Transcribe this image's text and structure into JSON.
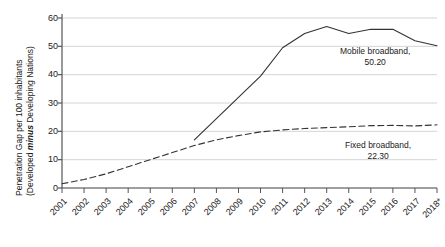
{
  "chart_data": {
    "type": "line",
    "title": "",
    "subtitle": "",
    "xlabel": "",
    "ylabel": "Penetration Gap per 100 inhabitants (Developed minus Developing Nations)",
    "ylabel_line1": "Penetration Gap per 100 inhabitants",
    "ylabel_line2_pre": "(Developed ",
    "ylabel_line2_em": "minus",
    "ylabel_line2_post": " Developing Nations)",
    "x": [
      "2001",
      "2002",
      "2003",
      "2004",
      "2005",
      "2006",
      "2007",
      "2008",
      "2009",
      "2010",
      "2011",
      "2012",
      "2013",
      "2014",
      "2015",
      "2016",
      "2017",
      "2018*"
    ],
    "xlim": [
      2001,
      2018
    ],
    "ylim": [
      0,
      60
    ],
    "yticks": [
      0,
      10,
      20,
      30,
      40,
      50,
      60
    ],
    "grid": true,
    "grid_axis": "y",
    "legend": "annotations",
    "series": [
      {
        "name": "Mobile broadband",
        "style": "solid",
        "color": "#333333",
        "end_label": "Mobile broadband,",
        "end_value_label": "50.20",
        "x": [
          "2007",
          "2008",
          "2009",
          "2010",
          "2011",
          "2012",
          "2013",
          "2014",
          "2015",
          "2016",
          "2017",
          "2018*"
        ],
        "values": [
          17.0,
          24.5,
          32.0,
          39.5,
          49.5,
          54.5,
          57.0,
          54.5,
          56.0,
          56.0,
          52.0,
          50.2
        ]
      },
      {
        "name": "Fixed broadband",
        "style": "dashed",
        "color": "#333333",
        "end_label": "Fixed broadband,",
        "end_value_label": "22.30",
        "x": [
          "2001",
          "2002",
          "2003",
          "2004",
          "2005",
          "2006",
          "2007",
          "2008",
          "2009",
          "2010",
          "2011",
          "2012",
          "2013",
          "2014",
          "2015",
          "2016",
          "2017",
          "2018*"
        ],
        "values": [
          1.5,
          3.0,
          5.0,
          7.5,
          10.0,
          12.5,
          15.0,
          17.0,
          18.5,
          19.8,
          20.5,
          21.0,
          21.3,
          21.6,
          22.0,
          22.1,
          21.9,
          22.3
        ]
      }
    ]
  },
  "axis": {
    "yticklabels": [
      "60",
      "50",
      "40",
      "30",
      "20",
      "10",
      "0"
    ],
    "xticklabels": [
      "2001",
      "2002",
      "2003",
      "2004",
      "2005",
      "2006",
      "2007",
      "2008",
      "2009",
      "2010",
      "2011",
      "2012",
      "2013",
      "2014",
      "2015",
      "2016",
      "2017",
      "2018*"
    ]
  },
  "annotations": {
    "mobile": {
      "line1": "Mobile broadband,",
      "line2": "50.20"
    },
    "fixed": {
      "line1": "Fixed broadband,",
      "line2": "22.30"
    }
  },
  "colors": {
    "line": "#333333",
    "grid": "#c9c9c9",
    "axis": "#555555",
    "text": "#1a1a1a",
    "background": "#ffffff"
  }
}
